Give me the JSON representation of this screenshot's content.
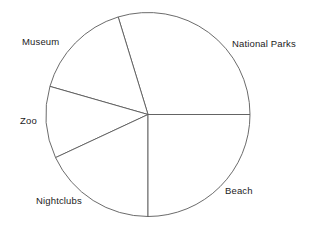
{
  "chart_data": {
    "type": "pie",
    "title": "",
    "subtitle": "",
    "xlabel": "",
    "ylabel": "",
    "legend_position": "none",
    "grid": false,
    "labels_placement": "outside-adjacent",
    "start_angle_deg": 0,
    "direction": "counterclockwise",
    "center_px": [
      148,
      114.5
    ],
    "radius_px": 102,
    "categories": [
      "National Parks",
      "Museum",
      "Zoo",
      "Nightclubs",
      "Beach"
    ],
    "values": [
      29.7,
      15.8,
      11.4,
      18.1,
      25.0
    ],
    "angles_deg": [
      107,
      57,
      41,
      65,
      90
    ],
    "boundary_angles_deg": [
      0,
      107,
      164,
      205,
      270,
      360
    ],
    "slices": [
      {
        "label": "National Parks",
        "value": 29.7,
        "angle_deg": 107,
        "start_deg": 0,
        "end_deg": 107,
        "color": "#ffffff",
        "stroke": "#5a5a5a"
      },
      {
        "label": "Museum",
        "value": 15.8,
        "angle_deg": 57,
        "start_deg": 107,
        "end_deg": 164,
        "color": "#ffffff",
        "stroke": "#5a5a5a"
      },
      {
        "label": "Zoo",
        "value": 11.4,
        "angle_deg": 41,
        "start_deg": 164,
        "end_deg": 205,
        "color": "#ffffff",
        "stroke": "#5a5a5a"
      },
      {
        "label": "Nightclubs",
        "value": 18.1,
        "angle_deg": 65,
        "start_deg": 205,
        "end_deg": 270,
        "color": "#ffffff",
        "stroke": "#5a5a5a"
      },
      {
        "label": "Beach",
        "value": 25.0,
        "angle_deg": 90,
        "start_deg": 270,
        "end_deg": 360,
        "color": "#ffffff",
        "stroke": "#5a5a5a"
      }
    ],
    "label_positions_px": [
      {
        "label": "National Parks",
        "x": 232,
        "y": 38
      },
      {
        "label": "Museum",
        "x": 22,
        "y": 36
      },
      {
        "label": "Zoo",
        "x": 20,
        "y": 115
      },
      {
        "label": "Nightclubs",
        "x": 36,
        "y": 195
      },
      {
        "label": "Beach",
        "x": 225,
        "y": 185
      }
    ]
  },
  "colors": {
    "background": "#ffffff",
    "line": "#5a5a5a",
    "text": "#1c1c1c"
  }
}
